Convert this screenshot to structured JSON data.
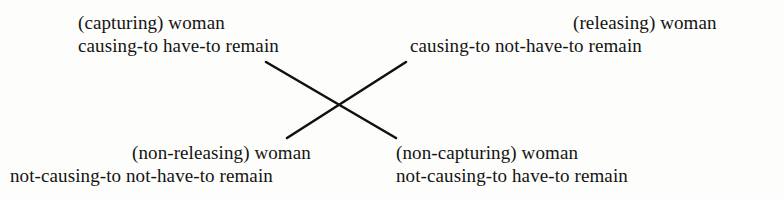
{
  "diagram": {
    "type": "semiotic-square",
    "background_color": "#fdfdfb",
    "text_color": "#141414",
    "line_color": "#111111",
    "terms": {
      "top_left": {
        "gloss": "(capturing) woman",
        "paraphrase": "causing-to have-to remain"
      },
      "top_right": {
        "gloss": "(releasing) woman",
        "paraphrase": "causing-to not-have-to remain"
      },
      "bottom_left": {
        "gloss": "(non-releasing) woman",
        "paraphrase": "not-causing-to not-have-to remain"
      },
      "bottom_right": {
        "gloss": "(non-capturing) woman",
        "paraphrase": "not-causing-to have-to remain"
      }
    },
    "connectors": [
      {
        "name": "diagonal-capturing-to-non-capturing",
        "from": "top_left",
        "to": "bottom_right",
        "x1": 266,
        "y1": 62,
        "x2": 396,
        "y2": 138
      },
      {
        "name": "diagonal-releasing-to-non-releasing",
        "from": "top_right",
        "to": "bottom_left",
        "x1": 406,
        "y1": 62,
        "x2": 287,
        "y2": 138
      }
    ],
    "crossing_point": {
      "x": 341,
      "y": 100
    }
  }
}
